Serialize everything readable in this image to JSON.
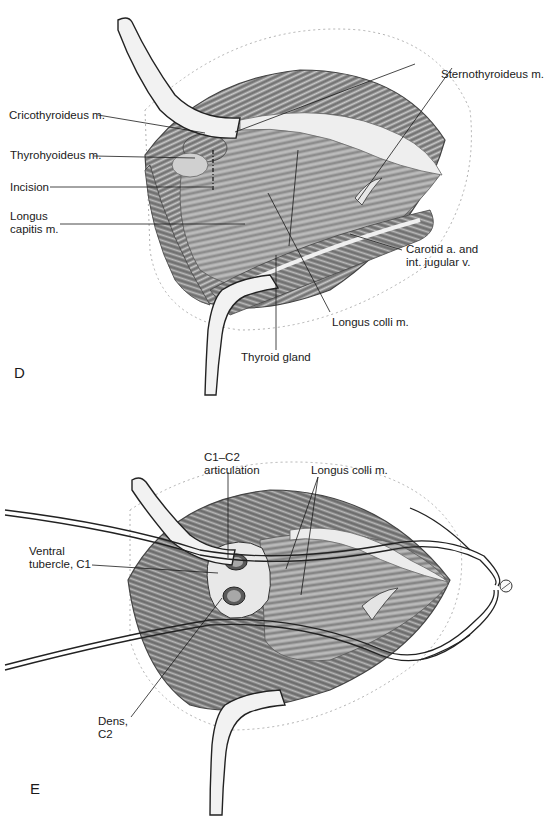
{
  "figure": {
    "panel_d": {
      "letter": "D",
      "labels": {
        "cricothyroideus": "Cricothyroideus m.",
        "thyrohyoideus": "Thyrohyoideus m.",
        "incision": "Incision",
        "longus_capitis_1": "Longus",
        "longus_capitis_2": "capitis m.",
        "sternothyroideus": "Sternothyroideus m.",
        "carotid_1": "Carotid a. and",
        "carotid_2": "int. jugular v.",
        "longus_colli": "Longus colli m.",
        "thyroid_gland": "Thyroid gland"
      }
    },
    "panel_e": {
      "letter": "E",
      "labels": {
        "c1c2_1": "C1–C2",
        "c1c2_2": "articulation",
        "longus_colli": "Longus colli m.",
        "ventral_tubercle_1": "Ventral",
        "ventral_tubercle_2": "tubercle, C1",
        "dens_1": "Dens,",
        "dens_2": "C2"
      }
    },
    "colors": {
      "ink": "#1a1a1a",
      "muscle_dark": "#6e6e6e",
      "muscle_mid": "#9a9a9a",
      "muscle_light": "#c8c8c8",
      "retractor_fill": "#f2f2f2",
      "dotted_outline": "#b0b0b0"
    }
  }
}
